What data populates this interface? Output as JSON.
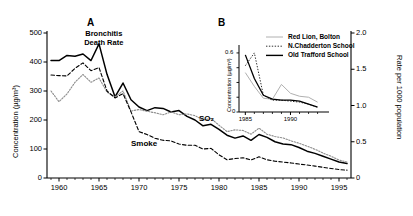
{
  "figure": {
    "panel_a_letter": "A",
    "panel_b_letter": "B"
  },
  "chart_data": [
    {
      "id": "panel_a",
      "type": "line",
      "title": "",
      "panel_label": "A",
      "xlabel": "",
      "ylabel": "Concentration (µg/m³)",
      "ylabel_right": "Rate per 1000 population",
      "xlim": [
        1958.5,
        1996.5
      ],
      "ylim": [
        0,
        500
      ],
      "ylim_right": [
        0,
        2.0
      ],
      "xticks": [
        1960,
        1965,
        1970,
        1975,
        1980,
        1985,
        1990,
        1995
      ],
      "xtick_labels": [
        "1960",
        "1965",
        "1970",
        "1975",
        "1980",
        "1985",
        "1990",
        "1995"
      ],
      "yticks": [
        0,
        100,
        200,
        300,
        400,
        500
      ],
      "ytick_labels": [
        "0",
        "100",
        "200",
        "300",
        "400",
        "500"
      ],
      "yticks_right": [
        0,
        0.5,
        1.0,
        1.5,
        2.0
      ],
      "ytick_labels_right": [
        "0",
        "0.5",
        "1.0",
        "1.5",
        "2.0"
      ],
      "grid": false,
      "annotations": [
        {
          "text": "Bronchitis\nDeath Rate",
          "line1": "Bronchitis",
          "line2": "Death Rate",
          "x": 1965.6,
          "y": 470
        },
        {
          "text": "SO₂",
          "x": 1978.5,
          "y": 205
        },
        {
          "text": "Smoke",
          "x": 1971.0,
          "y": 118
        }
      ],
      "series": [
        {
          "name": "Bronchitis Death Rate",
          "style": "solid",
          "color": "#000000",
          "axis": "right",
          "x": [
            1959,
            1960,
            1961,
            1962,
            1963,
            1964,
            1965,
            1966,
            1967,
            1968,
            1969,
            1970,
            1971,
            1972,
            1973,
            1974,
            1975,
            1976,
            1977,
            1978,
            1979,
            1980,
            1981,
            1982,
            1983,
            1984,
            1985,
            1986,
            1987,
            1988,
            1989,
            1990,
            1991,
            1992,
            1993,
            1994,
            1995,
            1996
          ],
          "values": [
            1.62,
            1.62,
            1.69,
            1.68,
            1.71,
            1.62,
            1.85,
            1.43,
            1.12,
            1.31,
            1.08,
            0.98,
            0.93,
            0.97,
            0.96,
            0.91,
            0.93,
            0.85,
            0.8,
            0.72,
            0.74,
            0.67,
            0.59,
            0.55,
            0.58,
            0.52,
            0.6,
            0.56,
            0.5,
            0.47,
            0.46,
            0.42,
            0.37,
            0.34,
            0.3,
            0.26,
            0.22,
            0.2
          ]
        },
        {
          "name": "SO2",
          "style": "dotted",
          "color": "#8c8c8c",
          "axis": "left",
          "x": [
            1959,
            1960,
            1961,
            1962,
            1963,
            1964,
            1965,
            1966,
            1967,
            1968,
            1969,
            1970,
            1971,
            1972,
            1973,
            1974,
            1975,
            1976,
            1977,
            1978,
            1979,
            1980,
            1981,
            1982,
            1983,
            1984,
            1985,
            1986,
            1987,
            1988,
            1989,
            1990,
            1991,
            1992,
            1993,
            1994,
            1995,
            1996
          ],
          "values": [
            300,
            263,
            290,
            330,
            357,
            330,
            345,
            296,
            280,
            300,
            231,
            236,
            230,
            225,
            218,
            228,
            218,
            221,
            215,
            200,
            205,
            182,
            160,
            166,
            164,
            151,
            172,
            151,
            143,
            138,
            128,
            120,
            110,
            99,
            86,
            75,
            62,
            55
          ]
        },
        {
          "name": "Smoke",
          "style": "dashed",
          "color": "#000000",
          "axis": "left",
          "x": [
            1959,
            1960,
            1961,
            1962,
            1963,
            1964,
            1965,
            1966,
            1967,
            1968,
            1969,
            1970,
            1971,
            1972,
            1973,
            1974,
            1975,
            1976,
            1977,
            1978,
            1979,
            1980,
            1981,
            1982,
            1983,
            1984,
            1985,
            1986,
            1987,
            1988,
            1989,
            1990,
            1991,
            1992,
            1993,
            1994,
            1995,
            1996
          ],
          "values": [
            355,
            353,
            352,
            378,
            397,
            370,
            381,
            300,
            276,
            291,
            228,
            160,
            150,
            137,
            130,
            128,
            117,
            113,
            113,
            100,
            102,
            80,
            63,
            67,
            70,
            62,
            73,
            63,
            58,
            55,
            52,
            48,
            45,
            41,
            37,
            33,
            29,
            27
          ]
        }
      ]
    },
    {
      "id": "panel_b",
      "type": "line",
      "panel_label": "B",
      "title": "",
      "xlabel": "",
      "ylabel": "Concentration (µg/m³)",
      "xlim": [
        1984.3,
        1993.6
      ],
      "ylim": [
        0,
        0.65
      ],
      "xticks": [
        1985,
        1990
      ],
      "xtick_labels": [
        "1985",
        "1990"
      ],
      "yticks": [
        0,
        0.6
      ],
      "ytick_labels": [
        "0",
        "0.6"
      ],
      "grid": false,
      "legend_position": "upper right outside",
      "series": [
        {
          "name": "Red Lion, Bolton",
          "style": "solid",
          "color": "#b0b0b0",
          "x": [
            1985,
            1986,
            1987,
            1988,
            1989,
            1990,
            1991,
            1992,
            1993
          ],
          "values": [
            0.4,
            0.26,
            0.14,
            0.13,
            0.28,
            0.19,
            0.16,
            0.15,
            0.1
          ]
        },
        {
          "name": "N.Chadderton School",
          "style": "dotted",
          "color": "#303030",
          "x": [
            1985,
            1986,
            1987,
            1988,
            1989,
            1990,
            1991,
            1992,
            1993
          ],
          "values": [
            0.47,
            0.6,
            0.17,
            0.12,
            0.12,
            0.11,
            0.1,
            0.08,
            0.05
          ]
        },
        {
          "name": "Old Trafford School",
          "style": "solid",
          "color": "#000000",
          "x": [
            1985,
            1986,
            1987,
            1988,
            1989,
            1990,
            1991,
            1992,
            1993
          ],
          "values": [
            0.58,
            0.34,
            0.17,
            0.13,
            0.12,
            0.12,
            0.11,
            0.08,
            0.05
          ]
        }
      ]
    }
  ]
}
